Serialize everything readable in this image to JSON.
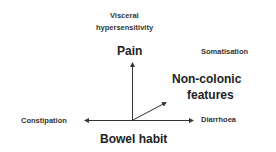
{
  "diagram": {
    "labels": {
      "visceral": "Visceral",
      "hypersensitivity": "hypersensitivity",
      "pain": "Pain",
      "somatisation": "Somatisation",
      "non_colonic_1": "Non-colonic",
      "non_colonic_2": "features",
      "constipation": "Constipation",
      "diarrhoea": "Diarrhoea",
      "bowel_habit": "Bowel habit"
    },
    "axes": [
      {
        "name": "Pain",
        "direction": "up"
      },
      {
        "name": "Bowel habit",
        "direction": "horizontal",
        "left": "Constipation",
        "right": "Diarrhoea"
      },
      {
        "name": "Non-colonic features",
        "direction": "diagonal-up-right"
      }
    ]
  }
}
